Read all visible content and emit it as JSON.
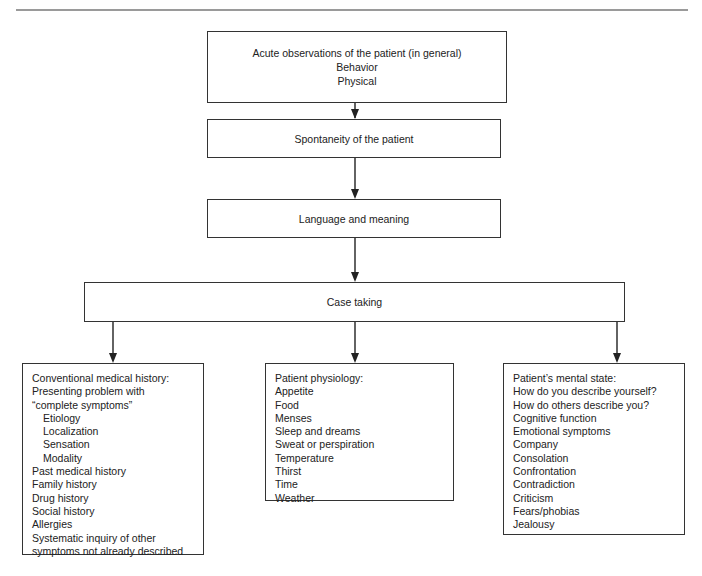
{
  "diagram": {
    "type": "flowchart",
    "nodes": {
      "acute_observations": {
        "lines": [
          "Acute observations of the patient (in general)",
          "Behavior",
          "Physical"
        ]
      },
      "spontaneity": {
        "label": "Spontaneity of the patient"
      },
      "language": {
        "label": "Language and meaning"
      },
      "case_taking": {
        "label": "Case taking"
      },
      "conventional_history": {
        "title": "Conventional medical history:",
        "items": [
          {
            "text": "Presenting problem with",
            "indent": false
          },
          {
            "text": "“complete symptoms”",
            "indent": false
          },
          {
            "text": "Etiology",
            "indent": true
          },
          {
            "text": "Localization",
            "indent": true
          },
          {
            "text": "Sensation",
            "indent": true
          },
          {
            "text": "Modality",
            "indent": true
          },
          {
            "text": "Past medical history",
            "indent": false
          },
          {
            "text": "Family history",
            "indent": false
          },
          {
            "text": "Drug history",
            "indent": false
          },
          {
            "text": "Social history",
            "indent": false
          },
          {
            "text": "Allergies",
            "indent": false
          },
          {
            "text": "Systematic inquiry of other",
            "indent": false
          },
          {
            "text": "symptoms not already described",
            "indent": false
          }
        ]
      },
      "physiology": {
        "title": "Patient physiology:",
        "items": [
          "Appetite",
          "Food",
          "Menses",
          "Sleep and dreams",
          "Sweat or perspiration",
          "Temperature",
          "Thirst",
          "Time",
          "Weather"
        ]
      },
      "mental_state": {
        "title": "Patient’s mental state:",
        "items": [
          "How do you describe yourself?",
          "How do others describe you?",
          "Cognitive function",
          "Emotional symptoms",
          "Company",
          "Consolation",
          "Confrontation",
          "Contradiction",
          "Criticism",
          "Fears/phobias",
          "Jealousy"
        ]
      }
    },
    "edges": [
      [
        "acute_observations",
        "spontaneity"
      ],
      [
        "spontaneity",
        "language"
      ],
      [
        "language",
        "case_taking"
      ],
      [
        "case_taking",
        "conventional_history"
      ],
      [
        "case_taking",
        "physiology"
      ],
      [
        "case_taking",
        "mental_state"
      ]
    ],
    "colors": {
      "border": "#333333",
      "text": "#222222",
      "rule": "#9a9a9a"
    }
  }
}
